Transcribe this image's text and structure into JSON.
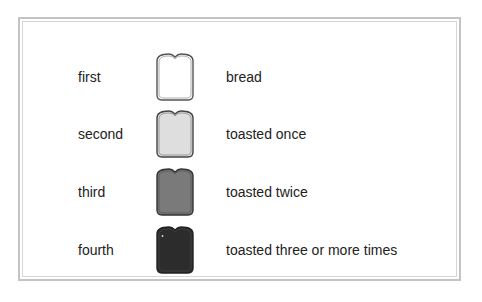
{
  "legend": {
    "rows": [
      {
        "order": "first",
        "description": "bread",
        "fill": "#ffffff",
        "stroke": "#555555"
      },
      {
        "order": "second",
        "description": "toasted once",
        "fill": "#dedede",
        "stroke": "#444444"
      },
      {
        "order": "third",
        "description": "toasted twice",
        "fill": "#7a7a7a",
        "stroke": "#333333"
      },
      {
        "order": "fourth",
        "description": "toasted three or more times",
        "fill": "#2c2c2c",
        "stroke": "#222222"
      }
    ]
  },
  "colors": {
    "frame_border": "#c4c4c4",
    "text": "#222222"
  }
}
